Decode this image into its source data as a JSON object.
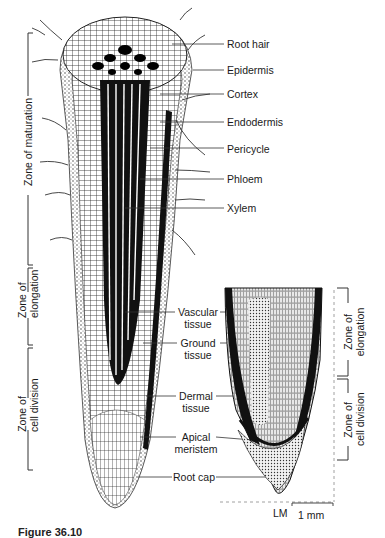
{
  "figure": {
    "main_labels": {
      "root_hair": "Root hair",
      "epidermis": "Epidermis",
      "cortex": "Cortex",
      "endodermis": "Endodermis",
      "pericycle": "Pericycle",
      "phloem": "Phloem",
      "xylem": "Xylem"
    },
    "center_labels": {
      "vascular_tissue": [
        "Vascular",
        "tissue"
      ],
      "ground_tissue": [
        "Ground",
        "tissue"
      ],
      "dermal_tissue": [
        "Dermal",
        "tissue"
      ],
      "apical_meristem": [
        "Apical",
        "meristem"
      ],
      "root_cap": "Root cap"
    },
    "left_zones": {
      "maturation": "Zone of maturation",
      "elongation": [
        "Zone of",
        "elongation"
      ],
      "cell_division": [
        "Zone of",
        "cell division"
      ]
    },
    "right_zones": {
      "elongation": [
        "Zone of",
        "elongation"
      ],
      "cell_division": [
        "Zone of",
        "cell division"
      ]
    },
    "micrograph": {
      "type": "LM",
      "scale_bar": "1 mm"
    },
    "caption_partial": "Figure 36.10"
  }
}
